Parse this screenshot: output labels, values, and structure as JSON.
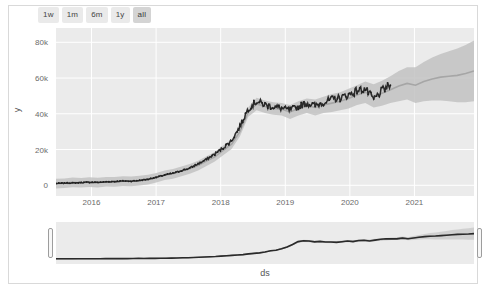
{
  "range_selector": {
    "buttons": [
      {
        "label": "1w",
        "active": false
      },
      {
        "label": "1m",
        "active": false
      },
      {
        "label": "6m",
        "active": false
      },
      {
        "label": "1y",
        "active": false
      },
      {
        "label": "all",
        "active": true
      }
    ]
  },
  "colors": {
    "plot_background": "#ebebeb",
    "gridline": "#ffffff",
    "observed_line": "#2a2a2a",
    "forecast_line": "#a6a6a6",
    "uncertainty_band": "#c2c2c2",
    "page_background": "#ffffff",
    "frame_border": "#d9d9d9",
    "button_background": "#eaeaea",
    "button_active_background": "#d4d4d4",
    "tick_text": "#6a6a6a"
  },
  "chart_data": {
    "type": "line",
    "title": "",
    "xlabel": "ds",
    "ylabel": "y",
    "grid": true,
    "legend": "none",
    "ylim": [
      -6000,
      88000
    ],
    "yticks": [
      0,
      20000,
      40000,
      60000,
      80000
    ],
    "ytick_labels": [
      "0",
      "20k",
      "40k",
      "60k",
      "80k"
    ],
    "xlim": [
      "2015-07",
      "2021-12"
    ],
    "xticks": [
      "2016",
      "2017",
      "2018",
      "2019",
      "2020",
      "2021"
    ],
    "series": [
      {
        "name": "yhat",
        "role": "forecast-line",
        "color": "#a6a6a6",
        "x": [
          0.0,
          0.02,
          0.04,
          0.06,
          0.08,
          0.1,
          0.12,
          0.14,
          0.16,
          0.18,
          0.2,
          0.22,
          0.24,
          0.26,
          0.28,
          0.3,
          0.32,
          0.34,
          0.36,
          0.38,
          0.4,
          0.42,
          0.44,
          0.46,
          0.48,
          0.5,
          0.52,
          0.54,
          0.56,
          0.58,
          0.6,
          0.62,
          0.64,
          0.66,
          0.68,
          0.7,
          0.72,
          0.74,
          0.76,
          0.78,
          0.8,
          0.82,
          0.84,
          0.86,
          0.88,
          0.9,
          0.92,
          0.94,
          0.96,
          0.98,
          1.0
        ],
        "values": [
          900,
          1100,
          1600,
          1400,
          1800,
          1500,
          2000,
          1900,
          2300,
          2200,
          2600,
          3200,
          4200,
          5600,
          6400,
          7800,
          9200,
          11000,
          13500,
          16000,
          19500,
          23000,
          30000,
          41000,
          45500,
          44000,
          43000,
          42500,
          41000,
          43000,
          44500,
          43500,
          45000,
          46000,
          47000,
          48500,
          50500,
          52000,
          50000,
          51500,
          53500,
          55500,
          57000,
          56000,
          58000,
          59500,
          60500,
          61000,
          61500,
          62500,
          64000
        ]
      },
      {
        "name": "y observed",
        "role": "observed-line",
        "color": "#2a2a2a",
        "x": [
          0.0,
          0.02,
          0.04,
          0.06,
          0.08,
          0.1,
          0.12,
          0.14,
          0.16,
          0.18,
          0.2,
          0.22,
          0.24,
          0.26,
          0.28,
          0.3,
          0.32,
          0.34,
          0.36,
          0.38,
          0.4,
          0.42,
          0.44,
          0.46,
          0.48,
          0.5,
          0.52,
          0.54,
          0.56,
          0.58,
          0.6,
          0.62,
          0.64,
          0.66,
          0.68,
          0.7,
          0.72,
          0.74,
          0.76,
          0.78,
          0.8
        ],
        "values": [
          1000,
          1200,
          1300,
          1500,
          1700,
          1600,
          1900,
          2100,
          2400,
          2300,
          2700,
          3400,
          4500,
          5800,
          6700,
          8200,
          9600,
          12000,
          14500,
          17500,
          21000,
          25000,
          33000,
          43000,
          47000,
          45000,
          44000,
          43000,
          42000,
          44000,
          46000,
          44500,
          46500,
          48000,
          49000,
          50500,
          53000,
          54000,
          48000,
          53000,
          56000
        ]
      },
      {
        "name": "uncertainty interval",
        "role": "uncertainty-band",
        "color": "#c2c2c2",
        "lower": [
          -1800,
          -1600,
          -1100,
          -1300,
          -900,
          -1200,
          -700,
          -800,
          -400,
          -500,
          -100,
          500,
          1500,
          2900,
          3700,
          5100,
          6500,
          8300,
          10800,
          13300,
          16800,
          20300,
          27300,
          38300,
          42000,
          40500,
          39500,
          39000,
          37000,
          39000,
          40500,
          39000,
          40500,
          41000,
          42000,
          43000,
          45000,
          46000,
          43500,
          44500,
          46000,
          47000,
          48000,
          46000,
          47000,
          47500,
          47500,
          47000,
          46500,
          46500,
          47000
        ],
        "upper": [
          3600,
          3800,
          4300,
          4100,
          4500,
          4200,
          4700,
          4600,
          5000,
          4900,
          5300,
          5900,
          6900,
          8300,
          9100,
          10500,
          11900,
          13700,
          16200,
          18700,
          22200,
          25700,
          32700,
          43700,
          49000,
          47500,
          46500,
          46000,
          45000,
          47000,
          48500,
          48000,
          49500,
          51000,
          52000,
          54000,
          56000,
          58000,
          56500,
          58500,
          61000,
          64000,
          66000,
          66000,
          69000,
          71500,
          73500,
          75000,
          76500,
          78500,
          81000
        ]
      }
    ]
  },
  "range_slider": {
    "handle_left_label": "range-slider-left-handle",
    "handle_right_label": "range-slider-right-handle",
    "mini_series": {
      "values": [
        900,
        1000,
        1050,
        1100,
        1150,
        1200,
        1250,
        1300,
        1400,
        1450,
        1500,
        1550,
        1600,
        1700,
        1750,
        1800,
        1900,
        2000,
        2100,
        2300,
        2500,
        2700,
        3000,
        3400,
        3800,
        4200,
        4700,
        5300,
        6000,
        6800,
        7600,
        8500,
        9500,
        10500,
        11500,
        13000,
        14500,
        16000,
        18000,
        20500,
        23000,
        26000,
        30000,
        36000,
        43000,
        46000,
        45000,
        44000,
        43500,
        43000,
        42500,
        43000,
        44000,
        45000,
        44500,
        46000,
        47000,
        46500,
        48000,
        49000,
        50000,
        51000,
        52000,
        53500,
        51000,
        53000,
        55000,
        56500,
        57500,
        58000,
        59000,
        60000,
        61000,
        62000,
        62500,
        63000,
        64000
      ]
    }
  }
}
